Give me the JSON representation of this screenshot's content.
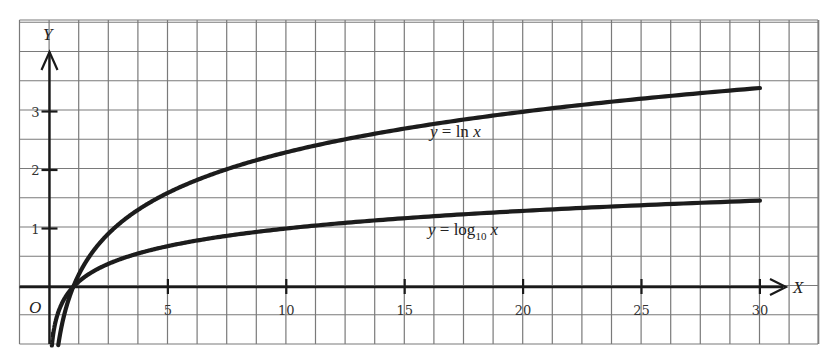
{
  "chart_data": {
    "type": "line",
    "title": "",
    "xlabel": "X",
    "ylabel": "Y",
    "origin_label": "O",
    "xlim": [
      -1.25,
      32.5
    ],
    "ylim": [
      -1.0,
      4.5
    ],
    "grid": true,
    "grid_step_x": 1.25,
    "grid_step_y": 0.5,
    "x_ticks": [
      5,
      10,
      15,
      20,
      25,
      30
    ],
    "x_tick_labels": [
      "5",
      "10",
      "15",
      "20",
      "25",
      "30"
    ],
    "y_ticks": [
      1,
      2,
      3
    ],
    "y_tick_labels": [
      "1",
      "2",
      "3"
    ],
    "series": [
      {
        "name": "y = ln x",
        "label_parts": {
          "lhs": "y",
          "eq": " = ",
          "fn": "ln ",
          "var": "x"
        },
        "function": "ln",
        "x": [
          0.37,
          0.5,
          1,
          2,
          3,
          5,
          7.5,
          10,
          15,
          20,
          25,
          30
        ],
        "values": [
          -1.0,
          -0.69,
          0.0,
          0.69,
          1.1,
          1.61,
          2.01,
          2.3,
          2.71,
          3.0,
          3.22,
          3.4
        ]
      },
      {
        "name": "y = log10 x",
        "label_parts": {
          "lhs": "y",
          "eq": " = ",
          "fn": "log",
          "sub": "10",
          "var": "x"
        },
        "function": "log10",
        "x": [
          0.1,
          0.5,
          1,
          2,
          3,
          5,
          7.5,
          10,
          15,
          20,
          25,
          30
        ],
        "values": [
          -1.0,
          -0.3,
          0.0,
          0.3,
          0.48,
          0.7,
          0.88,
          1.0,
          1.18,
          1.3,
          1.4,
          1.48
        ]
      }
    ]
  },
  "colors": {
    "grid": "#7a7a7a",
    "axis": "#1a1a1a",
    "curve": "#1c1c1c",
    "background": "#ffffff"
  }
}
